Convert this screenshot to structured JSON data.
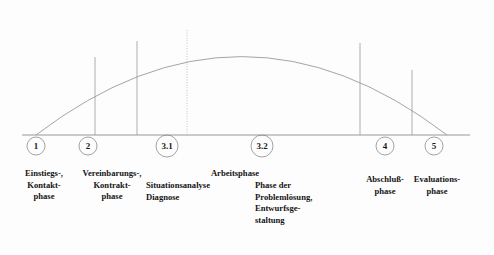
{
  "figure": {
    "type": "phase-model-arc-diagram",
    "language": "de",
    "baseline": {
      "y": 135,
      "x_start": 22,
      "x_end": 470,
      "color": "#8c8c8c"
    },
    "arc": {
      "left_x": 36,
      "right_x": 447,
      "base_y": 135,
      "apex_y": 18,
      "color": "#9a9a9a",
      "style": "solid"
    },
    "dividers": [
      {
        "name": "divider-1",
        "x": 95,
        "top_y": 57,
        "bottom_y": 135,
        "style": "solid",
        "color": "#9a9a9a"
      },
      {
        "name": "divider-2",
        "x": 137,
        "top_y": 41,
        "bottom_y": 135,
        "style": "solid",
        "color": "#9a9a9a"
      },
      {
        "name": "divider-3",
        "x": 187,
        "top_y": 30,
        "bottom_y": 135,
        "style": "dotted",
        "color": "#b4b4b4"
      },
      {
        "name": "divider-4",
        "x": 360,
        "top_y": 43,
        "bottom_y": 135,
        "style": "solid",
        "color": "#9a9a9a"
      },
      {
        "name": "divider-5",
        "x": 412,
        "top_y": 70,
        "bottom_y": 135,
        "style": "solid",
        "color": "#9a9a9a"
      }
    ],
    "nodes": [
      {
        "id": "node-1",
        "number": "1",
        "cx": 36,
        "cy": 146,
        "r": 9
      },
      {
        "id": "node-2",
        "number": "2",
        "cx": 88,
        "cy": 146,
        "r": 9
      },
      {
        "id": "node-3-1",
        "number": "3.1",
        "cx": 167,
        "cy": 146,
        "r": 11
      },
      {
        "id": "node-3-2",
        "number": "3.2",
        "cx": 262,
        "cy": 146,
        "r": 11
      },
      {
        "id": "node-4",
        "number": "4",
        "cx": 385,
        "cy": 146,
        "r": 9
      },
      {
        "id": "node-5",
        "number": "5",
        "cx": 434,
        "cy": 146,
        "r": 9
      }
    ],
    "group_heading": {
      "text": "Arbeitsphase",
      "x": 175,
      "y": 168,
      "width": 120
    },
    "phase_labels": [
      {
        "id": "label-einstiegs-kontaktphase",
        "text": "Einstiegs-,\nKontakt-\nphase",
        "x": 12,
        "y": 168,
        "width": 64,
        "align": "ctr"
      },
      {
        "id": "label-vereinbarungs-kontraktphase",
        "text": "Vereinbarungs-,\nKontrakt-\nphase",
        "x": 74,
        "y": 168,
        "width": 76,
        "align": "ctr"
      },
      {
        "id": "label-situationsanalyse-diagnose",
        "text": "Situationsanalyse\nDiagnose",
        "x": 146,
        "y": 180,
        "width": 82,
        "align": "lft"
      },
      {
        "id": "label-phase-problemloesung",
        "text": "Phase der\nProblemlösung,\nEntwurfsge-\nstaltung",
        "x": 255,
        "y": 180,
        "width": 80,
        "align": "lft"
      },
      {
        "id": "label-abschlussphase",
        "text": "Abschluß-\nphase",
        "x": 352,
        "y": 174,
        "width": 66,
        "align": "ctr"
      },
      {
        "id": "label-evaluationsphase",
        "text": "Evaluations-\nphase",
        "x": 404,
        "y": 174,
        "width": 66,
        "align": "ctr"
      }
    ]
  }
}
